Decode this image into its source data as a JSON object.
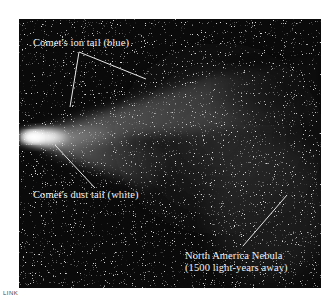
{
  "figure": {
    "colors": {
      "background": "#0a0a0a",
      "label_text": "#f2f2f2",
      "leader_line": "#e8e8e8",
      "comet_head": "#ffffff"
    },
    "annotations": [
      {
        "id": "ion-tail",
        "text": "Comet's ion tail (blue)"
      },
      {
        "id": "dust-tail",
        "text": "Comet's dust tail (white)"
      },
      {
        "id": "nebula-line1",
        "text": "North America Nebula"
      },
      {
        "id": "nebula-line2",
        "text": "(1500 light-years away)"
      }
    ]
  },
  "footer": {
    "link_tag": "LINK"
  }
}
